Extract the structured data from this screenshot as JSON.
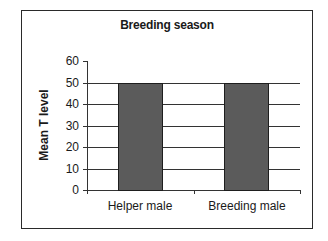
{
  "chart_data": {
    "type": "bar",
    "title": "Breeding season",
    "xlabel": "",
    "ylabel": "Mean T level",
    "categories": [
      "Helper male",
      "Breeding male"
    ],
    "values": [
      50,
      50
    ],
    "ylim": [
      0,
      60
    ],
    "yticks": [
      0,
      10,
      20,
      30,
      40,
      50,
      60
    ],
    "grid": true,
    "legend": null,
    "colors": {
      "bar_fill": "#5b5b5b",
      "bar_border": "#1e1e1e",
      "frame": "#2a2a2a"
    }
  }
}
